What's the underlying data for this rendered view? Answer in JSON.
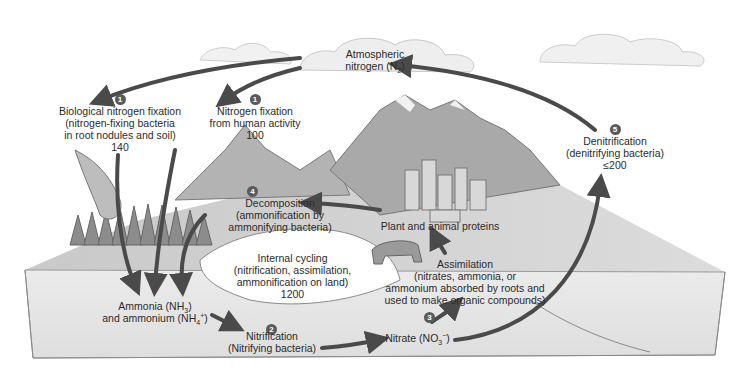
{
  "diagram": {
    "colors": {
      "arrow": "#4a4a4a",
      "badge": "#5a5a5a",
      "ground_front": "#e6e6e6",
      "ground_top": "#cfcfcf",
      "mountain": "#a8a8a8",
      "cloud": "#eeeeee"
    },
    "nodes": {
      "atmosphere": {
        "line1": "Atmospheric",
        "line2_prefix": "nitrogen (N",
        "line2_sub": "2",
        "line2_suffix": ")"
      },
      "bio_fixation": {
        "step": "1",
        "line1": "Biological nitrogen fixation",
        "line2": "(nitrogen-fixing bacteria",
        "line3": "in root nodules and soil)",
        "value": "140"
      },
      "human_fixation": {
        "step": "1",
        "line1": "Nitrogen fixation",
        "line2": "from human activity",
        "value": "100"
      },
      "denitrification": {
        "step": "5",
        "line1": "Denitrification",
        "line2": "(denitrifying bacteria)",
        "value": "≤200"
      },
      "decomposition": {
        "step": "4",
        "line1": "Decomposition",
        "line2": "(ammonification by",
        "line3": "ammonifying bacteria)"
      },
      "proteins": {
        "line1": "Plant and animal proteins"
      },
      "internal_cycling": {
        "line1": "Internal cycling",
        "line2": "(nitrification, assimilation,",
        "line3": "ammonification on land)",
        "value": "1200"
      },
      "assimilation": {
        "step": "3",
        "line1": "Assimilation",
        "line2": "(nitrates, ammonia, or",
        "line3": "ammonium absorbed by roots and",
        "line4": "used to make organic compounds)"
      },
      "ammonia": {
        "line1_prefix": "Ammonia (NH",
        "line1_sub": "3",
        "line1_suffix": ")",
        "line2_prefix": "and ammonium (NH",
        "line2_sub": "4",
        "line2_sup": "+",
        "line2_suffix": ")"
      },
      "nitrification": {
        "step": "2",
        "line1": "Nitrification",
        "line2": "(Nitrifying bacteria)"
      },
      "nitrate": {
        "prefix": "Nitrate (NO",
        "sub": "3",
        "sup": "−",
        "suffix": ")"
      }
    }
  }
}
